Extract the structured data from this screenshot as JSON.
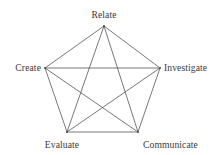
{
  "diagram": {
    "type": "pentagram-network",
    "title": "",
    "background_color": "#ffffff",
    "line_color": "#555555",
    "text_color": "#3a3a3a",
    "line_width": 0.8,
    "nodes": [
      {
        "id": "relate",
        "label": "Relate",
        "x": 104,
        "y": 26,
        "label_position": "top"
      },
      {
        "id": "investigate",
        "label": "Investigate",
        "x": 160,
        "y": 68,
        "label_position": "right"
      },
      {
        "id": "communicate",
        "label": "Communicate",
        "x": 138,
        "y": 132,
        "label_position": "bottom-right"
      },
      {
        "id": "evaluate",
        "label": "Evaluate",
        "x": 67,
        "y": 132,
        "label_position": "bottom-left"
      },
      {
        "id": "create",
        "label": "Create",
        "x": 45,
        "y": 68,
        "label_position": "left"
      }
    ],
    "edges": [
      {
        "from": "relate",
        "to": "investigate",
        "kind": "perimeter"
      },
      {
        "from": "investigate",
        "to": "communicate",
        "kind": "perimeter"
      },
      {
        "from": "communicate",
        "to": "evaluate",
        "kind": "perimeter"
      },
      {
        "from": "evaluate",
        "to": "create",
        "kind": "perimeter"
      },
      {
        "from": "create",
        "to": "relate",
        "kind": "perimeter"
      },
      {
        "from": "relate",
        "to": "communicate",
        "kind": "diagonal"
      },
      {
        "from": "relate",
        "to": "evaluate",
        "kind": "diagonal"
      },
      {
        "from": "investigate",
        "to": "evaluate",
        "kind": "diagonal"
      },
      {
        "from": "investigate",
        "to": "create",
        "kind": "diagonal"
      },
      {
        "from": "communicate",
        "to": "create",
        "kind": "diagonal"
      }
    ]
  }
}
